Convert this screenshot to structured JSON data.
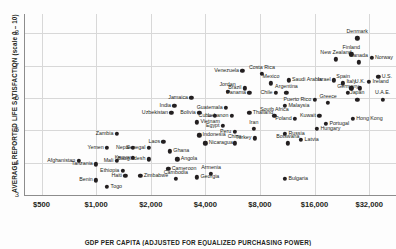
{
  "chart_data": {
    "type": "scatter",
    "title": "",
    "xlabel": "GDP PER CAPITA (ADJUSTED FOR EQUALIZED PURCHASING POWER)",
    "ylabel": "AVERAGE REPORTED LIFE SATISFACTION (scale 0 – 10)",
    "xscale": "log",
    "xlim": [
      400,
      45000
    ],
    "ylim": [
      3,
      8.6
    ],
    "xticks": [
      500,
      1000,
      2000,
      4000,
      8000,
      16000,
      32000
    ],
    "xticklabels": [
      "$500",
      "$1,000",
      "$2,000",
      "$4,000",
      "$8,000",
      "$16,000",
      "$32,000"
    ],
    "yticks": [
      3,
      4,
      5,
      6,
      7,
      8
    ],
    "yticklabels": [
      "3",
      "4",
      "5",
      "6",
      "7",
      "8"
    ],
    "grid": true,
    "legend": false,
    "marker_color": "#231f20",
    "points": [
      {
        "name": "Afghanistan",
        "x": 800,
        "y": 4.05,
        "lp": "r"
      },
      {
        "name": "Tanzania",
        "x": 1000,
        "y": 3.95,
        "lp": "r"
      },
      {
        "name": "Yemen",
        "x": 1150,
        "y": 4.45,
        "lp": "r"
      },
      {
        "name": "Zambia",
        "x": 1300,
        "y": 4.9,
        "lp": "r"
      },
      {
        "name": "Mali",
        "x": 1300,
        "y": 4.05,
        "lp": "r"
      },
      {
        "name": "Benin",
        "x": 1000,
        "y": 3.45,
        "lp": "r"
      },
      {
        "name": "Togo",
        "x": 1150,
        "y": 3.25,
        "lp": "l"
      },
      {
        "name": "Ethiopia",
        "x": 1400,
        "y": 3.75,
        "lp": "r"
      },
      {
        "name": "Nepal",
        "x": 1600,
        "y": 4.45,
        "lp": "r"
      },
      {
        "name": "Senegal",
        "x": 1950,
        "y": 4.45,
        "lp": "r"
      },
      {
        "name": "Kenya",
        "x": 1600,
        "y": 4.15,
        "lp": "r"
      },
      {
        "name": "Bangladesh",
        "x": 1950,
        "y": 4.1,
        "lp": "r"
      },
      {
        "name": "Haiti",
        "x": 1450,
        "y": 3.6,
        "lp": "r"
      },
      {
        "name": "Zimbabwe",
        "x": 1750,
        "y": 3.6,
        "lp": "l"
      },
      {
        "name": "Laos",
        "x": 2350,
        "y": 4.65,
        "lp": "r"
      },
      {
        "name": "Ghana",
        "x": 2550,
        "y": 4.35,
        "lp": "l"
      },
      {
        "name": "Angola",
        "x": 2800,
        "y": 4.1,
        "lp": "l"
      },
      {
        "name": "Cameroon",
        "x": 2500,
        "y": 3.8,
        "lp": "l"
      },
      {
        "name": "Cambodia",
        "x": 2750,
        "y": 3.5,
        "lp": "c"
      },
      {
        "name": "Georgia",
        "x": 3600,
        "y": 3.55,
        "lp": "l"
      },
      {
        "name": "Uzbekistan",
        "x": 2600,
        "y": 5.55,
        "lp": "r"
      },
      {
        "name": "Bolivia",
        "x": 3700,
        "y": 5.55,
        "lp": "r"
      },
      {
        "name": "Vietnam",
        "x": 3600,
        "y": 5.25,
        "lp": "l"
      },
      {
        "name": "Indonesia",
        "x": 3700,
        "y": 4.85,
        "lp": "l"
      },
      {
        "name": "Nicaragua",
        "x": 4000,
        "y": 4.6,
        "lp": "l"
      },
      {
        "name": "Armenia",
        "x": 4300,
        "y": 3.65,
        "lp": "c"
      },
      {
        "name": "India",
        "x": 2700,
        "y": 5.75,
        "lp": "r"
      },
      {
        "name": "Jamaica",
        "x": 3350,
        "y": 6.0,
        "lp": "r"
      },
      {
        "name": "Cuba",
        "x": 4500,
        "y": 5.45,
        "lp": "r"
      },
      {
        "name": "Egypt",
        "x": 5000,
        "y": 5.15,
        "lp": "r"
      },
      {
        "name": "Guatemala",
        "x": 5200,
        "y": 5.7,
        "lp": "r"
      },
      {
        "name": "Lebanon",
        "x": 5600,
        "y": 5.45,
        "lp": "r"
      },
      {
        "name": "Jordan",
        "x": 5300,
        "y": 6.2,
        "lp": "c"
      },
      {
        "name": "Peru",
        "x": 5800,
        "y": 4.95,
        "lp": "r"
      },
      {
        "name": "China",
        "x": 5800,
        "y": 4.6,
        "lp": "c"
      },
      {
        "name": "Iran",
        "x": 7400,
        "y": 5.05,
        "lp": "c"
      },
      {
        "name": "Turkey",
        "x": 7500,
        "y": 4.75,
        "lp": "r"
      },
      {
        "name": "Thailand",
        "x": 7000,
        "y": 5.55,
        "lp": "l"
      },
      {
        "name": "Venezuela",
        "x": 6400,
        "y": 6.85,
        "lp": "r"
      },
      {
        "name": "Brazil",
        "x": 6600,
        "y": 6.3,
        "lp": "r"
      },
      {
        "name": "Panama",
        "x": 7000,
        "y": 6.15,
        "lp": "r"
      },
      {
        "name": "Costa Rica",
        "x": 8200,
        "y": 6.75,
        "lp": "c"
      },
      {
        "name": "Mexico",
        "x": 9200,
        "y": 6.45,
        "lp": "c"
      },
      {
        "name": "Chile",
        "x": 9800,
        "y": 6.15,
        "lp": "r"
      },
      {
        "name": "Argentina",
        "x": 11200,
        "y": 6.15,
        "lp": "c"
      },
      {
        "name": "Saudi Arabia",
        "x": 11500,
        "y": 6.55,
        "lp": "l"
      },
      {
        "name": "Malaysia",
        "x": 11000,
        "y": 5.75,
        "lp": "l"
      },
      {
        "name": "South Africa",
        "x": 9600,
        "y": 5.45,
        "lp": "c"
      },
      {
        "name": "Poland",
        "x": 12500,
        "y": 5.35,
        "lp": "r"
      },
      {
        "name": "Russia",
        "x": 11000,
        "y": 4.9,
        "lp": "l"
      },
      {
        "name": "Botswana",
        "x": 11400,
        "y": 4.6,
        "lp": "c"
      },
      {
        "name": "Latvia",
        "x": 13500,
        "y": 4.7,
        "lp": "l"
      },
      {
        "name": "Bulgaria",
        "x": 11000,
        "y": 3.5,
        "lp": "l"
      },
      {
        "name": "Puerto Rico",
        "x": 16000,
        "y": 5.95,
        "lp": "r"
      },
      {
        "name": "Greece",
        "x": 19000,
        "y": 5.85,
        "lp": "c"
      },
      {
        "name": "Kuwait",
        "x": 17000,
        "y": 5.45,
        "lp": "r"
      },
      {
        "name": "Hungary",
        "x": 16500,
        "y": 5.05,
        "lp": "l"
      },
      {
        "name": "Portugal",
        "x": 18500,
        "y": 5.2,
        "lp": "l"
      },
      {
        "name": "Hong Kong",
        "x": 26000,
        "y": 5.35,
        "lp": "l"
      },
      {
        "name": "Israel",
        "x": 20500,
        "y": 6.55,
        "lp": "r"
      },
      {
        "name": "Spain",
        "x": 23000,
        "y": 6.45,
        "lp": "c"
      },
      {
        "name": "Italy",
        "x": 25500,
        "y": 6.3,
        "lp": "c"
      },
      {
        "name": "Germany",
        "x": 24500,
        "y": 6.15,
        "lp": "c"
      },
      {
        "name": "Japan",
        "x": 27500,
        "y": 5.95,
        "lp": "c"
      },
      {
        "name": "U.K.",
        "x": 28500,
        "y": 6.3,
        "lp": "c"
      },
      {
        "name": "New Zealand",
        "x": 21000,
        "y": 7.2,
        "lp": "c"
      },
      {
        "name": "Finland",
        "x": 25500,
        "y": 7.35,
        "lp": "c"
      },
      {
        "name": "Canada",
        "x": 28000,
        "y": 7.1,
        "lp": "c"
      },
      {
        "name": "Norway",
        "x": 33000,
        "y": 7.25,
        "lp": "l"
      },
      {
        "name": "Denmark",
        "x": 27500,
        "y": 7.85,
        "lp": "c"
      },
      {
        "name": "Ireland",
        "x": 32000,
        "y": 6.5,
        "lp": "l"
      },
      {
        "name": "U.S.",
        "x": 36000,
        "y": 6.65,
        "lp": "l"
      },
      {
        "name": "U.A.E.",
        "x": 38000,
        "y": 5.95,
        "lp": "c"
      }
    ]
  }
}
